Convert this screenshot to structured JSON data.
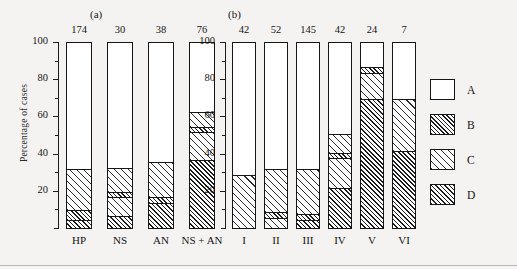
{
  "chart_data": {
    "type": "bar",
    "title": "",
    "subtitle": "",
    "xlabel": "",
    "ylabel": "Percentage of cases",
    "ylim": [
      0,
      100
    ],
    "yticks": [
      20,
      40,
      60,
      80,
      100
    ],
    "ytick_labels": [
      "20",
      "40",
      "60",
      "80",
      "100"
    ],
    "grid": false,
    "stacked": true,
    "stack_order_bottom_to_top": [
      "D",
      "C",
      "B",
      "A"
    ],
    "legend": {
      "position": "right",
      "entries": [
        {
          "label": "A",
          "pattern": "open-white"
        },
        {
          "label": "B",
          "pattern": "dense-diagonal-hatch"
        },
        {
          "label": "C",
          "pattern": "sparse-diagonal-hatch"
        },
        {
          "label": "D",
          "pattern": "cross-hatch"
        }
      ]
    },
    "panels": [
      {
        "id": "a",
        "label": "(a)",
        "categories": [
          "HP",
          "NS",
          "AN",
          "NS + AN"
        ],
        "counts": [
          174,
          30,
          38,
          76
        ],
        "bars": [
          {
            "category": "HP",
            "n": 174,
            "segments": [
              {
                "class": "D",
                "from": 0,
                "to": 5
              },
              {
                "class": "B",
                "from": 5,
                "to": 10
              },
              {
                "class": "C",
                "from": 10,
                "to": 32
              },
              {
                "class": "A",
                "from": 32,
                "to": 100
              }
            ]
          },
          {
            "category": "NS",
            "n": 30,
            "segments": [
              {
                "class": "D",
                "from": 0,
                "to": 7
              },
              {
                "class": "C",
                "from": 7,
                "to": 17
              },
              {
                "class": "B",
                "from": 17,
                "to": 20
              },
              {
                "class": "C",
                "from": 20,
                "to": 33
              },
              {
                "class": "A",
                "from": 33,
                "to": 100
              }
            ]
          },
          {
            "category": "AN",
            "n": 38,
            "segments": [
              {
                "class": "D",
                "from": 0,
                "to": 14
              },
              {
                "class": "B",
                "from": 14,
                "to": 17
              },
              {
                "class": "C",
                "from": 17,
                "to": 36
              },
              {
                "class": "A",
                "from": 36,
                "to": 100
              }
            ]
          },
          {
            "category": "NS + AN",
            "n": 76,
            "segments": [
              {
                "class": "D",
                "from": 0,
                "to": 37
              },
              {
                "class": "C",
                "from": 37,
                "to": 52
              },
              {
                "class": "B",
                "from": 52,
                "to": 55
              },
              {
                "class": "C",
                "from": 55,
                "to": 63
              },
              {
                "class": "A",
                "from": 63,
                "to": 100
              }
            ]
          }
        ]
      },
      {
        "id": "b",
        "label": "(b)",
        "categories": [
          "I",
          "II",
          "III",
          "IV",
          "V",
          "VI"
        ],
        "counts": [
          42,
          52,
          145,
          42,
          24,
          7
        ],
        "bars": [
          {
            "category": "I",
            "n": 42,
            "segments": [
              {
                "class": "C",
                "from": 0,
                "to": 29
              },
              {
                "class": "A",
                "from": 29,
                "to": 100
              }
            ]
          },
          {
            "category": "II",
            "n": 52,
            "segments": [
              {
                "class": "C",
                "from": 0,
                "to": 6
              },
              {
                "class": "B",
                "from": 6,
                "to": 9
              },
              {
                "class": "C",
                "from": 9,
                "to": 32
              },
              {
                "class": "A",
                "from": 32,
                "to": 100
              }
            ]
          },
          {
            "category": "III",
            "n": 145,
            "segments": [
              {
                "class": "D",
                "from": 0,
                "to": 5
              },
              {
                "class": "B",
                "from": 5,
                "to": 8
              },
              {
                "class": "C",
                "from": 8,
                "to": 32
              },
              {
                "class": "A",
                "from": 32,
                "to": 100
              }
            ]
          },
          {
            "category": "IV",
            "n": 42,
            "segments": [
              {
                "class": "D",
                "from": 0,
                "to": 22
              },
              {
                "class": "C",
                "from": 22,
                "to": 38
              },
              {
                "class": "B",
                "from": 38,
                "to": 41
              },
              {
                "class": "C",
                "from": 41,
                "to": 51
              },
              {
                "class": "A",
                "from": 51,
                "to": 100
              }
            ]
          },
          {
            "category": "V",
            "n": 24,
            "segments": [
              {
                "class": "D",
                "from": 0,
                "to": 70
              },
              {
                "class": "C",
                "from": 70,
                "to": 84
              },
              {
                "class": "B",
                "from": 84,
                "to": 87
              },
              {
                "class": "A",
                "from": 87,
                "to": 100
              }
            ]
          },
          {
            "category": "VI",
            "n": 7,
            "segments": [
              {
                "class": "D",
                "from": 0,
                "to": 42
              },
              {
                "class": "C",
                "from": 42,
                "to": 70
              },
              {
                "class": "A",
                "from": 70,
                "to": 100
              }
            ]
          }
        ]
      }
    ]
  }
}
